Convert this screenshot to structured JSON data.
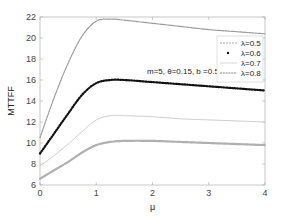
{
  "chart_data": {
    "type": "line",
    "title": "",
    "xlabel": "μ",
    "ylabel": "MTTFF",
    "xlim": [
      0,
      4
    ],
    "ylim": [
      6,
      22
    ],
    "xticks": [
      0,
      1,
      2,
      3,
      4
    ],
    "yticks": [
      6,
      8,
      10,
      12,
      14,
      16,
      18,
      20,
      22
    ],
    "grid": false,
    "legend_position": "upper right",
    "annotation": "m=5, θ=0.15, b =0.5, r=0.05",
    "x": [
      0,
      0.25,
      0.5,
      0.75,
      1.0,
      1.25,
      1.5,
      2.0,
      2.5,
      3.0,
      3.5,
      4.0
    ],
    "series": [
      {
        "name": "λ=0.5",
        "marker": "dashdot-plus",
        "color": "#999999",
        "values": [
          10.5,
          14.3,
          17.6,
          20.2,
          21.6,
          21.8,
          21.7,
          21.4,
          21.1,
          20.8,
          20.6,
          20.4
        ]
      },
      {
        "name": "λ=0.6",
        "marker": "dot",
        "color": "#111111",
        "values": [
          9.0,
          10.9,
          12.8,
          14.6,
          15.7,
          16.0,
          16.0,
          15.8,
          15.6,
          15.4,
          15.2,
          15.0
        ]
      },
      {
        "name": "λ=0.7",
        "marker": "line",
        "color": "#cccccc",
        "values": [
          7.8,
          8.8,
          9.9,
          11.1,
          12.2,
          12.6,
          12.6,
          12.5,
          12.3,
          12.2,
          12.1,
          12.0
        ]
      },
      {
        "name": "λ=0.8",
        "marker": "square-dash",
        "color": "#aaaaaa",
        "values": [
          6.6,
          7.4,
          8.2,
          9.1,
          9.8,
          10.1,
          10.2,
          10.2,
          10.1,
          10.0,
          9.9,
          9.8
        ]
      }
    ]
  }
}
